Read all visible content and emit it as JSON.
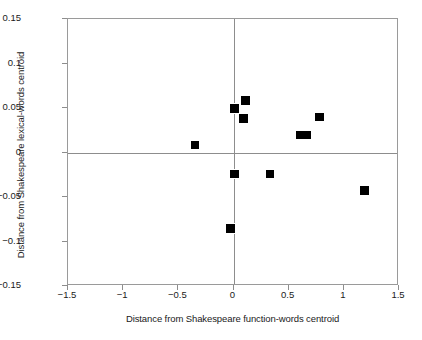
{
  "chart_data": {
    "type": "scatter",
    "title": "",
    "xlabel": "Distance from Shakespeare function-words centroid",
    "ylabel": "Distance from Shakespeare lexical-words centroid",
    "xlim": [
      -1.5,
      1.5
    ],
    "ylim": [
      -0.15,
      0.15
    ],
    "xticks": [
      "-1.5",
      "-1",
      "-0.5",
      "0",
      "0.5",
      "1",
      "1.5"
    ],
    "xtick_values": [
      -1.5,
      -1,
      -0.5,
      0,
      0.5,
      1,
      1.5
    ],
    "yticks": [
      "0.15",
      "0.1",
      "0.05",
      "0",
      "-0.05",
      "-0.1",
      "-0.15"
    ],
    "ytick_values": [
      0.15,
      0.1,
      0.05,
      0,
      -0.05,
      -0.1,
      -0.15
    ],
    "grid": false,
    "legend": null,
    "marker_color": "#000000",
    "marker_shape": "square",
    "axis_color": "#8d8d8d",
    "points": [
      {
        "x": -0.35,
        "y": 0.008,
        "w": 8,
        "h": 8
      },
      {
        "x": -0.03,
        "y": -0.085,
        "w": 9,
        "h": 9
      },
      {
        "x": 0.01,
        "y": 0.05,
        "w": 9,
        "h": 9
      },
      {
        "x": 0.01,
        "y": -0.024,
        "w": 9,
        "h": 8
      },
      {
        "x": 0.09,
        "y": 0.038,
        "w": 9,
        "h": 9
      },
      {
        "x": 0.11,
        "y": 0.058,
        "w": 9,
        "h": 9
      },
      {
        "x": 0.33,
        "y": -0.024,
        "w": 8,
        "h": 8
      },
      {
        "x": 0.63,
        "y": 0.02,
        "w": 15,
        "h": 8
      },
      {
        "x": 0.78,
        "y": 0.04,
        "w": 9,
        "h": 8
      },
      {
        "x": 1.19,
        "y": -0.043,
        "w": 9,
        "h": 9
      }
    ]
  }
}
